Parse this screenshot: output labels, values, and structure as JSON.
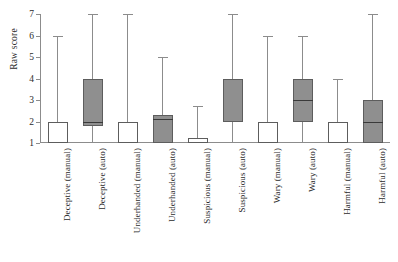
{
  "chart_data": {
    "type": "box",
    "title": "",
    "xlabel": "",
    "ylabel": "Raw score",
    "ylim": [
      1,
      7
    ],
    "yticks": [
      1,
      2,
      3,
      4,
      5,
      6,
      7
    ],
    "ytick_labels": [
      "1",
      "2",
      "3",
      "4",
      "5",
      "6",
      "7"
    ],
    "grid": false,
    "legend": "none",
    "categories": [
      "Deceptive (manual)",
      "Deceptive (auto)",
      "Underhanded (manual)",
      "Underhanded (auto)",
      "Suspicious (manual)",
      "Suspicious (auto)",
      "Wary (manual)",
      "Wary (auto)",
      "Harmful (manual)",
      "Harmful (auto)"
    ],
    "boxes": [
      {
        "label": "Deceptive (manual)",
        "condition": "manual",
        "fill": "#ffffff",
        "whisker_low": 1,
        "q1": 1,
        "median": 1,
        "q3": 2,
        "whisker_high": 6
      },
      {
        "label": "Deceptive (auto)",
        "condition": "auto",
        "fill": "#8f8f8f",
        "whisker_low": 1,
        "q1": 1.8,
        "median": 2,
        "q3": 4,
        "whisker_high": 7
      },
      {
        "label": "Underhanded (manual)",
        "condition": "manual",
        "fill": "#ffffff",
        "whisker_low": 1,
        "q1": 1,
        "median": 1,
        "q3": 2,
        "whisker_high": 7
      },
      {
        "label": "Underhanded (auto)",
        "condition": "auto",
        "fill": "#8f8f8f",
        "whisker_low": 1,
        "q1": 1,
        "median": 2.1,
        "q3": 2.3,
        "whisker_high": 5
      },
      {
        "label": "Suspicious (manual)",
        "condition": "manual",
        "fill": "#ffffff",
        "whisker_low": 1,
        "q1": 1,
        "median": 1,
        "q3": 1.25,
        "whisker_high": 2.7
      },
      {
        "label": "Suspicious (auto)",
        "condition": "auto",
        "fill": "#8f8f8f",
        "whisker_low": 1,
        "q1": 2,
        "median": 2,
        "q3": 4,
        "whisker_high": 7
      },
      {
        "label": "Wary (manual)",
        "condition": "manual",
        "fill": "#ffffff",
        "whisker_low": 1,
        "q1": 1,
        "median": 1,
        "q3": 2,
        "whisker_high": 6
      },
      {
        "label": "Wary (auto)",
        "condition": "auto",
        "fill": "#8f8f8f",
        "whisker_low": 1,
        "q1": 2,
        "median": 3,
        "q3": 4,
        "whisker_high": 6
      },
      {
        "label": "Harmful (manual)",
        "condition": "manual",
        "fill": "#ffffff",
        "whisker_low": 1,
        "q1": 1,
        "median": 1,
        "q3": 2,
        "whisker_high": 4
      },
      {
        "label": "Harmful (auto)",
        "condition": "auto",
        "fill": "#8f8f8f",
        "whisker_low": 1,
        "q1": 1,
        "median": 2,
        "q3": 3,
        "whisker_high": 7
      }
    ],
    "colors": {
      "manual_fill": "#ffffff",
      "auto_fill": "#8f8f8f",
      "box_stroke": "#5d5d5d",
      "median_stroke": "#3a3a3a",
      "axis": "#8c8c8c",
      "text": "#2b2b2b",
      "background": "#ffffff"
    }
  }
}
